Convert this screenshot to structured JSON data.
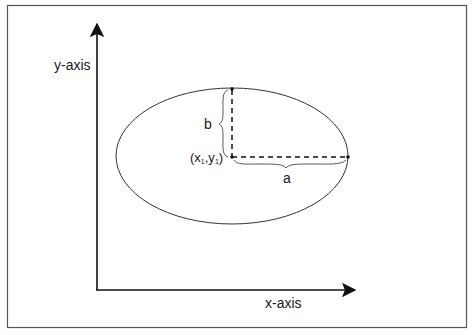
{
  "diagram": {
    "x_axis": {
      "label": "x-axis"
    },
    "y_axis": {
      "label": "y-axis"
    },
    "ellipse": {
      "center_label": {
        "prefix": "(x",
        "sub1": "1",
        "mid": ",y",
        "sub2": "1",
        "suffix": ")"
      },
      "semi_major_label": "a",
      "semi_minor_label": "b"
    },
    "colors": {
      "stroke": "#1a1a1a",
      "frame": "#555555",
      "background": "#ffffff"
    }
  }
}
